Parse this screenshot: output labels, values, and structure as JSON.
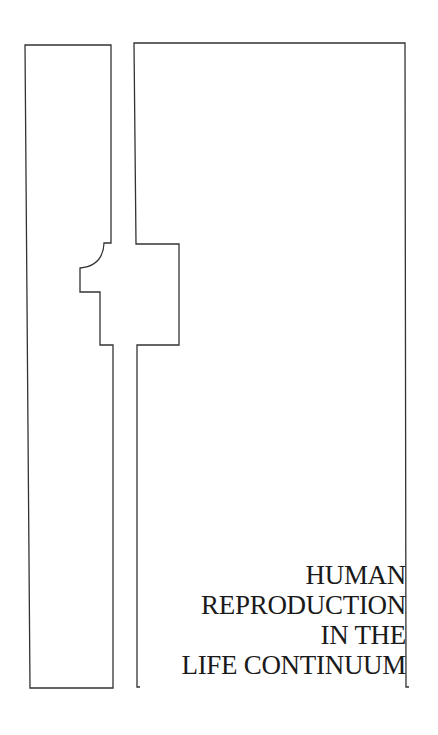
{
  "cover": {
    "title_lines": [
      "HUMAN",
      "REPRODUCTION",
      "IN THE",
      "LIFE CONTINUUM"
    ],
    "colors": {
      "background": "#ffffff",
      "line": "#333333",
      "text": "#1a1a1a"
    }
  }
}
